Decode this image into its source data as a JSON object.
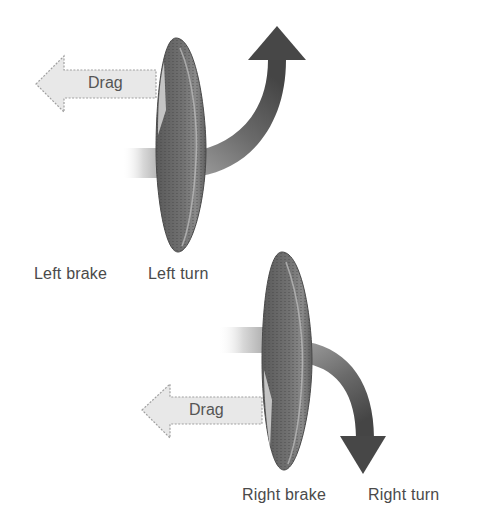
{
  "diagram": {
    "top_panel": {
      "drag_label": "Drag",
      "brake_label": "Left brake",
      "turn_label": "Left turn"
    },
    "bottom_panel": {
      "drag_label": "Drag",
      "brake_label": "Right brake",
      "turn_label": "Right turn"
    },
    "colors": {
      "background": "#ffffff",
      "canopy_fill": "#6a6a6a",
      "canopy_dark": "#4e4e4e",
      "turn_arrow": "#505050",
      "drag_arrow_fill": "#e6e6e6",
      "drag_arrow_stroke": "#9a9a9a",
      "label_text": "#4a4a4a"
    }
  }
}
